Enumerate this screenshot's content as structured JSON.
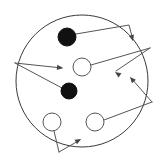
{
  "figure": {
    "type": "node-link-diagram",
    "title": "",
    "canvas": {
      "width": 164,
      "height": 163,
      "background": "#ffffff"
    },
    "boundary": {
      "name": "outer-boundary-circle",
      "shape": "circle",
      "cx": 82,
      "cy": 81,
      "r": 66,
      "stroke": "#3a3a3a",
      "fill": "#ffffff",
      "stroke_width": 1
    },
    "legend": {
      "visible": false,
      "entries": []
    },
    "axis_labels": {
      "visible": false
    },
    "annotations": [],
    "nodes": [
      {
        "id": "n1",
        "name": "filled-node-upper",
        "style": "filled",
        "cx": 67,
        "cy": 37,
        "r": 9,
        "fill": "#111111",
        "stroke": "#111111"
      },
      {
        "id": "n2",
        "name": "filled-node-lower",
        "style": "filled",
        "cx": 69,
        "cy": 91,
        "r": 8,
        "fill": "#111111",
        "stroke": "#111111"
      },
      {
        "id": "n3",
        "name": "open-node-center",
        "style": "open",
        "cx": 82,
        "cy": 67,
        "r": 9,
        "fill": "#ffffff",
        "stroke": "#555555"
      },
      {
        "id": "n4",
        "name": "open-node-bottom-left",
        "style": "open",
        "cx": 52,
        "cy": 122,
        "r": 9,
        "fill": "#ffffff",
        "stroke": "#555555"
      },
      {
        "id": "n5",
        "name": "open-node-bottom-right",
        "style": "open",
        "cx": 95,
        "cy": 122,
        "r": 9,
        "fill": "#ffffff",
        "stroke": "#555555"
      }
    ],
    "edges": [
      {
        "id": "e1",
        "name": "edge-upper-filled-to-top-right",
        "from": "filled-node-upper",
        "to": "top-right-arrowhead",
        "points": "76,34 129,25 133,40",
        "arrow": {
          "x": 133,
          "y": 41,
          "angle": 75
        }
      },
      {
        "id": "e2",
        "name": "edge-left-vertex-to-center-arrow",
        "from": "left-edge-vertex",
        "to": "center-arrowhead",
        "points": "15,63 62,68",
        "arrow": {
          "x": 63,
          "y": 68,
          "angle": 6
        }
      },
      {
        "id": "e3",
        "name": "edge-left-vertex-to-lower-filled",
        "from": "left-edge-vertex",
        "to": "filled-node-lower",
        "points": "15,63 62,88",
        "arrow": null
      },
      {
        "id": "e4",
        "name": "edge-center-open-to-right-vertex",
        "from": "open-node-center",
        "to": "right-upper-vertex",
        "points": "91,65 150,48",
        "arrow": null
      },
      {
        "id": "e5",
        "name": "edge-right-vertex-to-mid-arrow",
        "from": "right-upper-vertex",
        "to": "mid-right-arrowhead",
        "points": "150,48 116,71",
        "arrow": {
          "x": 115,
          "y": 72,
          "angle": 214
        }
      },
      {
        "id": "e6",
        "name": "edge-right-lower-vertex-to-arrow",
        "from": "right-lower-vertex",
        "to": "lower-right-arrowhead",
        "points": "152,102 131,78",
        "arrow": {
          "x": 130,
          "y": 77,
          "angle": 229
        }
      },
      {
        "id": "e7",
        "name": "edge-bottom-right-open-to-right-vertex",
        "from": "open-node-bottom-right",
        "to": "right-lower-vertex",
        "points": "104,120 152,102",
        "arrow": null
      },
      {
        "id": "e8",
        "name": "edge-bottom-left-open-to-bottom-vertex",
        "from": "open-node-bottom-left",
        "to": "bottom-vertex",
        "points": "54,131 59,152",
        "arrow": null
      },
      {
        "id": "e9",
        "name": "edge-bottom-vertex-to-arrow",
        "from": "bottom-vertex",
        "to": "bottom-arrowhead",
        "points": "59,152 80,140",
        "arrow": {
          "x": 81,
          "y": 139,
          "angle": 330
        }
      }
    ],
    "counts": {
      "filled_nodes": 2,
      "open_nodes": 3,
      "edges": 9,
      "arrowheads": 5
    }
  }
}
